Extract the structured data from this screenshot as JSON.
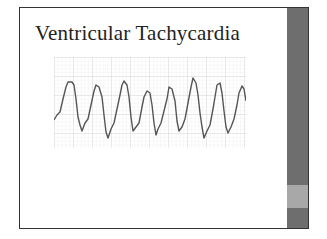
{
  "slide": {
    "title": "Ventricular Tachycardia",
    "image": {
      "description": "ECG strip showing ventricular tachycardia",
      "icon": "ecg-waveform-image"
    }
  },
  "colors": {
    "border": "#333333",
    "sidebar": "#6e6e6e",
    "sidebar_band": "#a8a8a8",
    "grid_minor": "#e4e4e4",
    "grid_major": "#c8c8c8",
    "trace": "#555555"
  }
}
